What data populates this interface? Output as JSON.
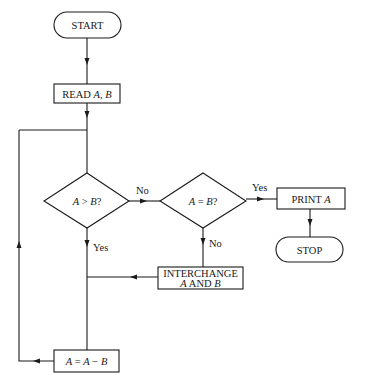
{
  "flowchart": {
    "colors": {
      "stroke": "#1a1a1a",
      "background": "#ffffff"
    },
    "nodes": {
      "start": {
        "type": "terminator",
        "label": "START"
      },
      "read": {
        "type": "process",
        "label_plain": "READ ",
        "label_vars": "A, B"
      },
      "decision_gt": {
        "type": "decision",
        "var_a": "A",
        "op": " > ",
        "var_b": "B",
        "suffix": "?"
      },
      "decision_eq": {
        "type": "decision",
        "var_a": "A",
        "op": " = ",
        "var_b": "B",
        "suffix": "?"
      },
      "print": {
        "type": "process",
        "label_plain": "PRINT ",
        "label_vars": "A"
      },
      "stop": {
        "type": "terminator",
        "label": "STOP"
      },
      "interchange": {
        "type": "process",
        "line1": "INTERCHANGE",
        "line2_a": "A",
        "line2_and": " AND ",
        "line2_b": "B"
      },
      "subtract": {
        "type": "process",
        "lhs": "A",
        "eq": " = ",
        "rhs_a": "A",
        "minus": " − ",
        "rhs_b": "B"
      }
    },
    "edge_labels": {
      "gt_no": "No",
      "gt_yes": "Yes",
      "eq_yes": "Yes",
      "eq_no": "No"
    }
  }
}
